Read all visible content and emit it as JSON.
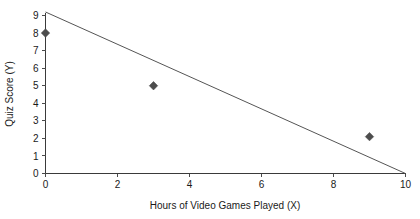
{
  "chart_data": {
    "type": "scatter",
    "title": "",
    "subtitle": "",
    "xlabel": "Hours of Video Games Played (X)",
    "ylabel": "Quiz Score (Y)",
    "xlim": [
      0,
      10
    ],
    "ylim": [
      0,
      9
    ],
    "xticks": [
      0,
      2,
      4,
      6,
      8,
      10
    ],
    "yticks": [
      0,
      1,
      2,
      3,
      4,
      5,
      6,
      7,
      8,
      9
    ],
    "xtick_labels": [
      "0",
      "2",
      "4",
      "6",
      "8",
      "10"
    ],
    "ytick_labels": [
      "0",
      "1",
      "2",
      "3",
      "4",
      "5",
      "6",
      "7",
      "8",
      "9"
    ],
    "grid": false,
    "legend": false,
    "legend_position": "none",
    "marker_shape": "diamond",
    "marker_color": "#4d4d4d",
    "points": [
      {
        "x": 0,
        "y": 8
      },
      {
        "x": 3,
        "y": 5
      },
      {
        "x": 9,
        "y": 2.1
      }
    ],
    "series": [
      {
        "name": "Quiz Score vs Hours Played",
        "x": [
          0,
          3,
          9
        ],
        "y": [
          8,
          5,
          2.1
        ]
      }
    ],
    "trend_line": {
      "type": "linear",
      "color": "#555555",
      "x_start": 0,
      "y_start": 9.2,
      "x_end": 10,
      "y_end": 0,
      "slope": -0.92,
      "intercept": 9.2
    }
  },
  "axes": {
    "x_axis_name": "x-axis",
    "y_axis_name": "y-axis"
  }
}
